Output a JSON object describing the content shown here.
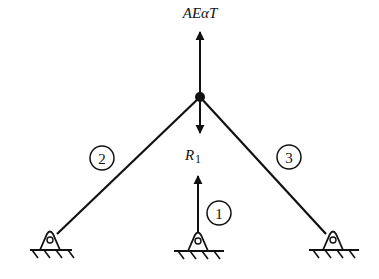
{
  "diagram": {
    "title_label": "AEαT",
    "reaction_label": "R",
    "reaction_subscript": "1",
    "members": [
      {
        "id": "1",
        "label": "1"
      },
      {
        "id": "2",
        "label": "2"
      },
      {
        "id": "3",
        "label": "3"
      }
    ],
    "colors": {
      "stroke": "#111111",
      "background": "#ffffff"
    }
  }
}
